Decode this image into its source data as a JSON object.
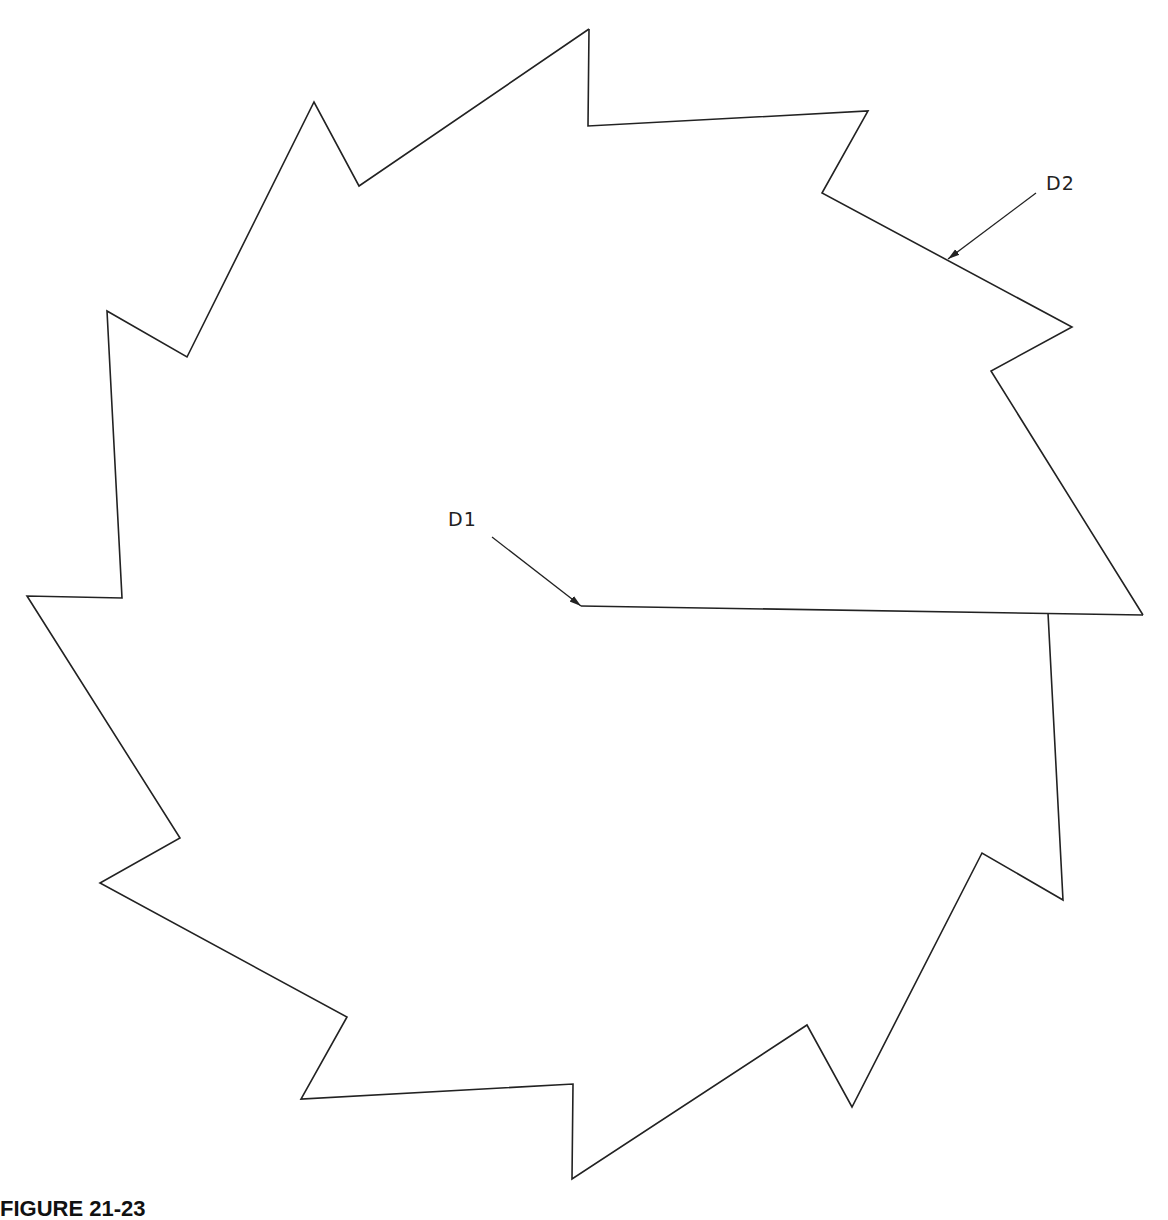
{
  "figure": {
    "caption": "FIGURE 21-23",
    "stroke_color": "#222222",
    "background": "#ffffff"
  },
  "labels": {
    "d1": {
      "text": "D1",
      "x": 448,
      "y": 508
    },
    "d2": {
      "text": "D2",
      "x": 1046,
      "y": 172
    }
  },
  "shape": {
    "type": "saw-blade polygon",
    "outline_points": "589,29 588,126 868,111 822,193 1072,327 991,371 1143,615",
    "inner_points": "1048,613 1063,900 982,853 852,1107 807,1025 572,1179 573,1084 301,1099 347,1017 100,883 180,838 27,596 122,598 107,311 187,357 314,102 359,186 589,29",
    "radial_line": {
      "x1": 581,
      "y1": 606,
      "x2": 1143,
      "y2": 615
    }
  },
  "leaders": {
    "d1": {
      "x1": 492,
      "y1": 537,
      "x2": 581,
      "y2": 606
    },
    "d2": {
      "x1": 1036,
      "y1": 193,
      "x2": 948,
      "y2": 259
    }
  }
}
